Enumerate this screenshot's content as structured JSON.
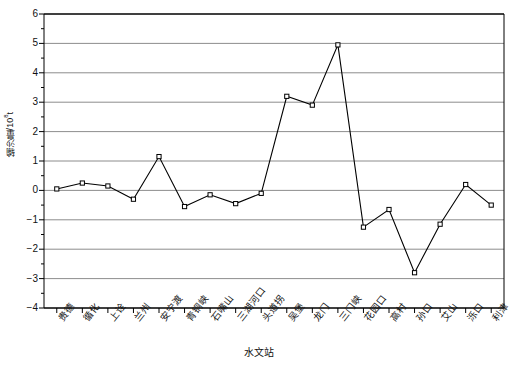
{
  "chart_data": {
    "type": "line",
    "title": "",
    "xlabel": "水文站",
    "ylabel_text": "输沙量/10",
    "ylabel_sup": "8",
    "ylabel_unit": "t",
    "ylabel_full": "输沙量/10⁸t",
    "categories": [
      "贵德",
      "循化",
      "上诠",
      "兰州",
      "安宁渡",
      "青铜峡",
      "石嘴山",
      "三湖河口",
      "头道拐",
      "吴堡",
      "龙门",
      "三门峡",
      "花园口",
      "高村",
      "孙口",
      "艾山",
      "泺口",
      "利津"
    ],
    "values": [
      0.05,
      0.25,
      0.15,
      -0.3,
      1.15,
      -0.55,
      -0.15,
      -0.45,
      -0.1,
      3.2,
      2.9,
      4.95,
      -1.25,
      -0.65,
      -2.8,
      -1.15,
      0.2,
      -0.5
    ],
    "series": [
      {
        "name": "输沙量",
        "values": [
          0.05,
          0.25,
          0.15,
          -0.3,
          1.15,
          -0.55,
          -0.15,
          -0.45,
          -0.1,
          3.2,
          2.9,
          4.95,
          -1.25,
          -0.65,
          -2.8,
          -1.15,
          0.2,
          -0.5
        ]
      }
    ],
    "ylim": [
      -4,
      6
    ],
    "yticks": [
      6,
      5,
      4,
      3,
      2,
      1,
      0,
      -1,
      -2,
      -3,
      -4
    ],
    "ytick_labels": [
      "6",
      "5",
      "4",
      "3",
      "2",
      "1",
      "0",
      "-1",
      "-2",
      "-3",
      "-4"
    ],
    "grid": true,
    "grid_axis": "y",
    "legend": null,
    "marker": "square-open",
    "line_color": "#000000",
    "grid_color": "#808080",
    "axis_color": "#000000",
    "marker_fill": "#ffffff",
    "background": "#ffffff"
  }
}
